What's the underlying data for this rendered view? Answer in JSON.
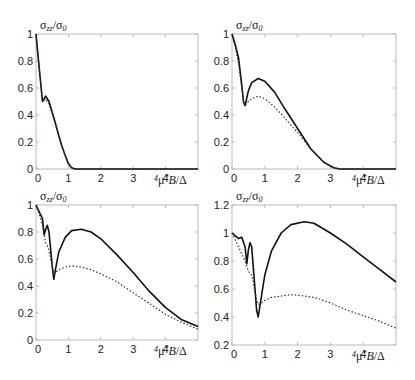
{
  "figure": {
    "ylabel": "σzz/σ0",
    "xlabel": "4μ*B/Δ"
  },
  "chart_data": [
    {
      "type": "line",
      "panel": "top-left",
      "title": "",
      "xlabel": "4μ*B/Δ",
      "ylabel": "σzz/σ0",
      "xlim": [
        0,
        5
      ],
      "ylim": [
        0,
        1
      ],
      "xticks": [
        "0",
        "1",
        "2",
        "3",
        "4"
      ],
      "yticks": [
        "0",
        "0.2",
        "0.4",
        "0.6",
        "0.8",
        "1"
      ],
      "grid": false,
      "series": [
        {
          "name": "solid",
          "style": "solid",
          "x": [
            0,
            0.1,
            0.2,
            0.25,
            0.3,
            0.4,
            0.5,
            0.6,
            0.7,
            0.8,
            0.9,
            1.0,
            1.1,
            1.2,
            1.5,
            2,
            3,
            4,
            5
          ],
          "y": [
            1.0,
            0.75,
            0.5,
            0.52,
            0.54,
            0.5,
            0.42,
            0.34,
            0.25,
            0.17,
            0.1,
            0.04,
            0.01,
            0,
            0,
            0,
            0,
            0,
            0
          ]
        },
        {
          "name": "dotted",
          "style": "dotted",
          "x": [
            0,
            0.1,
            0.2,
            0.25,
            0.3,
            0.4,
            0.5,
            0.6,
            0.7,
            0.8,
            0.9,
            1.0,
            1.1,
            1.2,
            1.5,
            2,
            3,
            4,
            5
          ],
          "y": [
            1.0,
            0.75,
            0.5,
            0.51,
            0.52,
            0.48,
            0.41,
            0.33,
            0.25,
            0.17,
            0.1,
            0.04,
            0.01,
            0,
            0,
            0,
            0,
            0,
            0
          ]
        }
      ]
    },
    {
      "type": "line",
      "panel": "top-right",
      "title": "",
      "xlabel": "4μ*B/Δ",
      "ylabel": "σzz/σ0",
      "xlim": [
        0,
        5
      ],
      "ylim": [
        0,
        1
      ],
      "xticks": [
        "0",
        "1",
        "2",
        "3",
        "4"
      ],
      "yticks": [
        "0",
        "0.2",
        "0.4",
        "0.6",
        "0.8",
        "1"
      ],
      "grid": false,
      "series": [
        {
          "name": "solid",
          "style": "solid",
          "x": [
            0,
            0.1,
            0.2,
            0.3,
            0.35,
            0.4,
            0.5,
            0.6,
            0.8,
            1.0,
            1.3,
            1.6,
            2.0,
            2.4,
            2.8,
            3.1,
            3.3,
            4,
            5
          ],
          "y": [
            1.0,
            0.92,
            0.82,
            0.62,
            0.5,
            0.47,
            0.58,
            0.64,
            0.67,
            0.65,
            0.57,
            0.45,
            0.3,
            0.15,
            0.05,
            0.01,
            0,
            0,
            0
          ]
        },
        {
          "name": "dotted",
          "style": "dotted",
          "x": [
            0,
            0.1,
            0.2,
            0.3,
            0.35,
            0.4,
            0.5,
            0.6,
            0.8,
            1.0,
            1.3,
            1.6,
            2.0,
            2.4,
            2.8,
            3.1,
            3.3,
            4,
            5
          ],
          "y": [
            1.0,
            0.9,
            0.78,
            0.6,
            0.5,
            0.47,
            0.5,
            0.52,
            0.54,
            0.52,
            0.46,
            0.38,
            0.27,
            0.15,
            0.05,
            0.01,
            0,
            0,
            0
          ]
        }
      ]
    },
    {
      "type": "line",
      "panel": "bottom-left",
      "title": "",
      "xlabel": "4μ*B/Δ",
      "ylabel": "σzz/σ0",
      "xlim": [
        0,
        5
      ],
      "ylim": [
        0,
        1
      ],
      "xticks": [
        "0",
        "1",
        "2",
        "3",
        "4"
      ],
      "yticks": [
        "0",
        "0.2",
        "0.4",
        "0.6",
        "0.8",
        "1"
      ],
      "grid": false,
      "series": [
        {
          "name": "solid",
          "style": "solid",
          "x": [
            0,
            0.1,
            0.2,
            0.25,
            0.3,
            0.35,
            0.4,
            0.5,
            0.55,
            0.6,
            0.7,
            0.9,
            1.1,
            1.4,
            1.7,
            2.0,
            2.5,
            3.0,
            3.5,
            4.0,
            4.5,
            5.0
          ],
          "y": [
            1.0,
            0.95,
            0.9,
            0.78,
            0.82,
            0.85,
            0.8,
            0.55,
            0.45,
            0.52,
            0.65,
            0.76,
            0.81,
            0.82,
            0.8,
            0.75,
            0.63,
            0.5,
            0.36,
            0.24,
            0.15,
            0.1
          ]
        },
        {
          "name": "dotted",
          "style": "dotted",
          "x": [
            0,
            0.1,
            0.2,
            0.25,
            0.3,
            0.35,
            0.4,
            0.5,
            0.55,
            0.6,
            0.7,
            0.9,
            1.1,
            1.4,
            1.7,
            2.0,
            2.5,
            3.0,
            3.5,
            4.0,
            4.5,
            5.0
          ],
          "y": [
            1.0,
            0.93,
            0.85,
            0.78,
            0.72,
            0.7,
            0.66,
            0.55,
            0.48,
            0.5,
            0.52,
            0.54,
            0.55,
            0.54,
            0.52,
            0.49,
            0.43,
            0.35,
            0.27,
            0.19,
            0.13,
            0.08
          ]
        }
      ]
    },
    {
      "type": "line",
      "panel": "bottom-right",
      "title": "",
      "xlabel": "4μ*B/Δ",
      "ylabel": "σzz/σ0",
      "xlim": [
        0,
        5
      ],
      "ylim": [
        0.2,
        1.2
      ],
      "xticks": [
        "0",
        "1",
        "2",
        "3",
        "4"
      ],
      "yticks": [
        "0.2",
        "0.4",
        "0.6",
        "0.8",
        "1",
        "1.2"
      ],
      "grid": false,
      "series": [
        {
          "name": "solid",
          "style": "solid",
          "x": [
            0,
            0.1,
            0.2,
            0.3,
            0.4,
            0.45,
            0.5,
            0.55,
            0.6,
            0.7,
            0.75,
            0.8,
            0.9,
            1.0,
            1.2,
            1.5,
            1.8,
            2.2,
            2.5,
            3.0,
            3.5,
            4.0,
            4.5,
            5.0
          ],
          "y": [
            1.0,
            0.98,
            0.96,
            0.97,
            0.9,
            0.78,
            0.88,
            0.93,
            0.9,
            0.6,
            0.45,
            0.4,
            0.55,
            0.7,
            0.87,
            1.0,
            1.06,
            1.08,
            1.07,
            1.0,
            0.92,
            0.83,
            0.74,
            0.65
          ]
        },
        {
          "name": "dotted",
          "style": "dotted",
          "x": [
            0,
            0.1,
            0.2,
            0.3,
            0.4,
            0.45,
            0.5,
            0.55,
            0.6,
            0.7,
            0.75,
            0.8,
            0.9,
            1.0,
            1.2,
            1.5,
            1.8,
            2.2,
            2.5,
            3.0,
            3.5,
            4.0,
            4.5,
            5.0
          ],
          "y": [
            1.0,
            0.95,
            0.9,
            0.85,
            0.8,
            0.76,
            0.73,
            0.71,
            0.7,
            0.58,
            0.52,
            0.49,
            0.5,
            0.52,
            0.54,
            0.55,
            0.56,
            0.55,
            0.54,
            0.5,
            0.45,
            0.41,
            0.37,
            0.32
          ]
        }
      ]
    }
  ]
}
